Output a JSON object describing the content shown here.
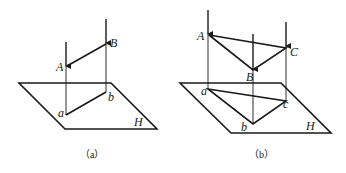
{
  "figure_a": {
    "caption": "（a）",
    "plane_label": "H",
    "points": {
      "A": "A",
      "B": "B",
      "a": "a",
      "b": "b"
    }
  },
  "figure_b": {
    "caption": "（b）",
    "plane_label": "H",
    "points": {
      "A": "A",
      "B": "B",
      "C": "C",
      "a": "a",
      "b": "b",
      "c": "c"
    }
  },
  "colors": {
    "line": "#1a1a1a",
    "background": "#ffffff"
  }
}
